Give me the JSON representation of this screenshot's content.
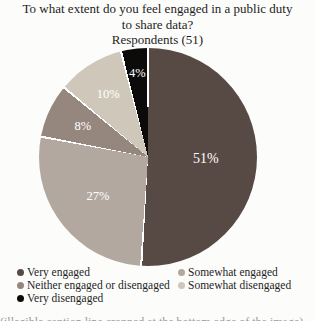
{
  "title": {
    "lines": [
      "To what extent do you feel engaged in a public duty",
      "to share data?"
    ],
    "subtitle": "Respondents (51)"
  },
  "footer": {
    "cropped_text": "(illegible caption line cropped at the bottom edge of the image)"
  },
  "chart_data": {
    "type": "pie",
    "title": "To what extent do you feel engaged in a public duty to share data?",
    "subtitle": "Respondents (51)",
    "respondents": 51,
    "start_angle_deg": 0,
    "direction": "clockwise",
    "legend_position": "bottom, two columns",
    "slice_separator_color": "#ffffff",
    "label_text_color": "#ffffff",
    "slices": [
      {
        "label": "Very engaged",
        "value_pct": 51,
        "display": "51%",
        "color": "#574a45",
        "label_r": 0.53
      },
      {
        "label": "Somewhat engaged",
        "value_pct": 27,
        "display": "27%",
        "color": "#b2a8a0",
        "label_r": 0.58
      },
      {
        "label": "Neither engaged or disengaged",
        "value_pct": 8,
        "display": "8%",
        "color": "#96877e",
        "label_r": 0.66
      },
      {
        "label": "Somewhat disengaged",
        "value_pct": 10,
        "display": "10%",
        "color": "#cfc8ba",
        "label_r": 0.68
      },
      {
        "label": "Very disengaged",
        "value_pct": 4,
        "display": "4%",
        "color": "#0d0b0a",
        "label_r": 0.78
      }
    ]
  }
}
